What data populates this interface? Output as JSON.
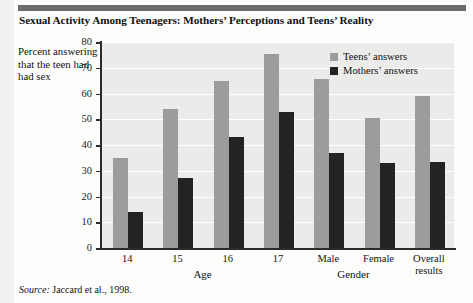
{
  "figure": {
    "title": "Sexual Activity Among Teenagers: Mothers’ Perceptions and Teens’ Reality",
    "source_prefix": "Source:",
    "source_text": " Jaccard et al., 1998."
  },
  "legend": {
    "position": "top-right",
    "entries": [
      {
        "label": "Teens’ answers",
        "color": "#9c9c9c"
      },
      {
        "label": "Mothers’ answers",
        "color": "#232323"
      }
    ]
  },
  "axis": {
    "y_caption": "Percent answering that the teen had had sex",
    "y_ticks": [
      "0",
      "10",
      "20",
      "30",
      "40",
      "50",
      "60",
      "70",
      "80"
    ],
    "section_labels": [
      "Age",
      "Gender"
    ]
  },
  "chart_data": {
    "type": "bar",
    "title": "Sexual Activity Among Teenagers: Mothers’ Perceptions and Teens’ Reality",
    "xlabel": "",
    "ylabel": "Percent answering that the teen had had sex",
    "ylim": [
      0,
      80
    ],
    "ytick_step": 10,
    "grid": true,
    "legend_position": "top-right",
    "categories": [
      "14",
      "15",
      "16",
      "17",
      "Male",
      "Female",
      "Overall results"
    ],
    "category_groups": [
      {
        "name": "Age",
        "categories": [
          "14",
          "15",
          "16",
          "17"
        ]
      },
      {
        "name": "Gender",
        "categories": [
          "Male",
          "Female"
        ]
      },
      {
        "name": "",
        "categories": [
          "Overall results"
        ]
      }
    ],
    "series": [
      {
        "name": "Teens’ answers",
        "color": "#9c9c9c",
        "values": [
          35,
          54,
          65,
          75.5,
          65.5,
          50.5,
          59
        ]
      },
      {
        "name": "Mothers’ answers",
        "color": "#232323",
        "values": [
          14,
          27,
          43,
          53,
          37,
          33,
          33.5
        ]
      }
    ]
  }
}
